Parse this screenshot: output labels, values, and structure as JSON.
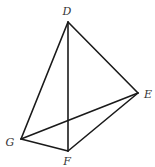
{
  "figure": {
    "type": "tetrahedron",
    "vertices": {
      "D": {
        "label": "D",
        "x": 68,
        "y": 22,
        "label_x": 67,
        "label_y": 15
      },
      "E": {
        "label": "E",
        "x": 138,
        "y": 93,
        "label_x": 148,
        "label_y": 98
      },
      "G": {
        "label": "G",
        "x": 21,
        "y": 139,
        "label_x": 10,
        "label_y": 146
      },
      "F": {
        "label": "F",
        "x": 68,
        "y": 151,
        "label_x": 67,
        "label_y": 165
      }
    },
    "edges": [
      [
        "D",
        "E"
      ],
      [
        "D",
        "G"
      ],
      [
        "D",
        "F"
      ],
      [
        "G",
        "E"
      ],
      [
        "G",
        "F"
      ],
      [
        "F",
        "E"
      ]
    ],
    "colors": {
      "stroke": "#1a1a1a",
      "label": "#333333",
      "background": "#ffffff"
    }
  }
}
